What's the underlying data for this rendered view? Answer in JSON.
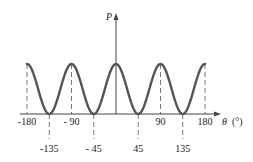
{
  "chart_data": {
    "type": "line",
    "title": "",
    "xlabel": "θ (°)",
    "ylabel": "P",
    "xlim": [
      -180,
      180
    ],
    "ylim": [
      0,
      1
    ],
    "grid": false,
    "legend": null,
    "function": "P ∝ cos²(2θ)",
    "x": [
      -180,
      -135,
      -90,
      -45,
      0,
      45,
      90,
      135,
      180
    ],
    "values": [
      1,
      0,
      1,
      0,
      1,
      0,
      1,
      0,
      1
    ],
    "series": [
      {
        "name": "P",
        "x": [
          -180,
          -135,
          -90,
          -45,
          0,
          45,
          90,
          135,
          180
        ],
        "values": [
          1,
          0,
          1,
          0,
          1,
          0,
          1,
          0,
          1
        ]
      }
    ],
    "upper_tick_labels": [
      "-180",
      "- 90",
      "90",
      "180"
    ],
    "lower_tick_labels": [
      "-135",
      "- 45",
      "45",
      "135"
    ],
    "curve_color": "#555555",
    "axis_color": "#444444"
  },
  "axes": {
    "y_label": "P",
    "x_label_symbol": "θ",
    "x_label_unit": "(°)"
  },
  "ticks": {
    "upper": [
      {
        "value": -180,
        "label": "-180"
      },
      {
        "value": -90,
        "label": "- 90"
      },
      {
        "value": 90,
        "label": "90"
      },
      {
        "value": 180,
        "label": "180"
      }
    ],
    "lower": [
      {
        "value": -135,
        "label": "-135"
      },
      {
        "value": -45,
        "label": "- 45"
      },
      {
        "value": 45,
        "label": "45"
      },
      {
        "value": 135,
        "label": "135"
      }
    ]
  }
}
